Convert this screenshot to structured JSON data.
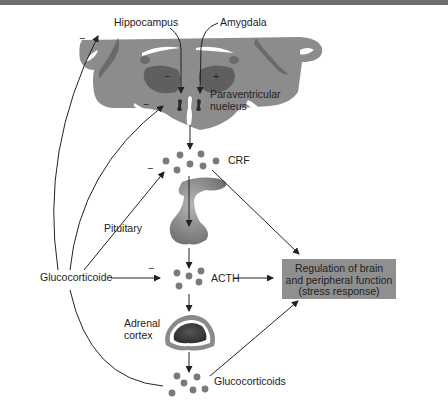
{
  "figure": {
    "labels": {
      "hippocampus": "Hippocampus",
      "amygdala": "Amygdala",
      "pvn_line1": "Paraventricular",
      "pvn_line2": "nueleus",
      "crf": "CRF",
      "pituitary": "Pituitary",
      "acth": "ACTH",
      "glucocorticoide": "Glucocorticoide",
      "adrenal_line1": "Adrenal",
      "adrenal_line2": "cortex",
      "glucocorticoids": "Glucocorticoids"
    },
    "signs": {
      "hippocampus_effect": "−",
      "amygdala_effect": "+",
      "hippocampus_feedback": "−",
      "pvn_feedback": "−",
      "crf_feedback": "−",
      "acth_feedback": "−"
    },
    "output_box": {
      "line1": "Regulation of brain",
      "line2": "and peripheral function",
      "line3": "(stress response)"
    },
    "colors": {
      "brain": "#8c8c8c",
      "brain_dark": "#5f5f5f",
      "nucleus": "#2a2a2a",
      "box": "#8f8f8f",
      "dots": "#7a7a7a",
      "top_band": "#6e6e6e"
    }
  }
}
